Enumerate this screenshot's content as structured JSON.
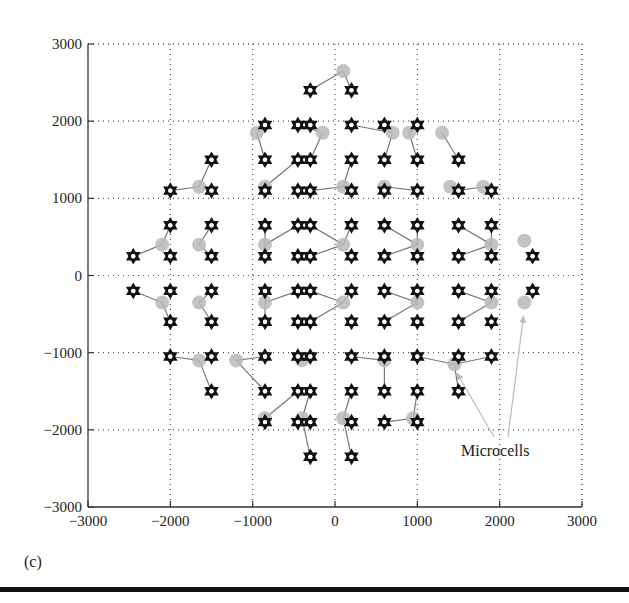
{
  "panel_label": "(c)",
  "annotation": {
    "text": "Microcells"
  },
  "colors": {
    "node": "#111111",
    "microcell": "#b8b8b8",
    "link": "#777777",
    "grid": "#555555",
    "arrow": "#bbbbbb"
  },
  "chart_data": {
    "type": "scatter",
    "title": "",
    "xlabel": "",
    "ylabel": "",
    "xlim": [
      -3000,
      3000
    ],
    "ylim": [
      -3000,
      3000
    ],
    "grid": true,
    "grid_style": "dotted",
    "xticks": [
      -3000,
      -2000,
      -1000,
      0,
      1000,
      2000,
      3000
    ],
    "yticks": [
      -3000,
      -2000,
      -1000,
      0,
      1000,
      2000,
      3000
    ],
    "xtick_labels": [
      "−3000",
      "−2000",
      "−1000",
      "0",
      "1000",
      "2000",
      "3000"
    ],
    "ytick_labels": [
      "−3000",
      "−2000",
      "−1000",
      "0",
      "1000",
      "2000",
      "3000"
    ],
    "annotations": [
      {
        "text": "Microcells",
        "x": 1900,
        "y": -2300,
        "arrows_to": [
          [
            1450,
            -1250
          ],
          [
            2280,
            -500
          ]
        ]
      }
    ],
    "series": [
      {
        "name": "Base stations",
        "marker": "star-of-david",
        "points": [
          [
            -300,
            2400
          ],
          [
            200,
            2400
          ],
          [
            -850,
            1950
          ],
          [
            -450,
            1950
          ],
          [
            -300,
            1950
          ],
          [
            200,
            1950
          ],
          [
            600,
            1950
          ],
          [
            1000,
            1950
          ],
          [
            -1500,
            1500
          ],
          [
            -850,
            1500
          ],
          [
            -450,
            1500
          ],
          [
            -300,
            1500
          ],
          [
            200,
            1500
          ],
          [
            600,
            1500
          ],
          [
            1000,
            1500
          ],
          [
            1500,
            1500
          ],
          [
            -2000,
            1100
          ],
          [
            -1500,
            1100
          ],
          [
            -850,
            1100
          ],
          [
            -450,
            1100
          ],
          [
            -300,
            1100
          ],
          [
            200,
            1100
          ],
          [
            600,
            1100
          ],
          [
            1000,
            1100
          ],
          [
            1500,
            1100
          ],
          [
            1900,
            1100
          ],
          [
            -2000,
            650
          ],
          [
            -1500,
            650
          ],
          [
            -850,
            650
          ],
          [
            -450,
            650
          ],
          [
            -300,
            650
          ],
          [
            200,
            650
          ],
          [
            600,
            650
          ],
          [
            1000,
            650
          ],
          [
            1500,
            650
          ],
          [
            1900,
            650
          ],
          [
            -2450,
            250
          ],
          [
            -2000,
            250
          ],
          [
            -1500,
            250
          ],
          [
            -850,
            250
          ],
          [
            -450,
            250
          ],
          [
            -300,
            250
          ],
          [
            200,
            250
          ],
          [
            600,
            250
          ],
          [
            1000,
            250
          ],
          [
            1500,
            250
          ],
          [
            1900,
            250
          ],
          [
            2400,
            250
          ],
          [
            -2450,
            -200
          ],
          [
            -2000,
            -200
          ],
          [
            -1500,
            -200
          ],
          [
            -850,
            -200
          ],
          [
            -450,
            -200
          ],
          [
            -300,
            -200
          ],
          [
            200,
            -200
          ],
          [
            600,
            -200
          ],
          [
            1000,
            -200
          ],
          [
            1500,
            -200
          ],
          [
            1900,
            -200
          ],
          [
            2400,
            -200
          ],
          [
            -2000,
            -600
          ],
          [
            -1500,
            -600
          ],
          [
            -850,
            -600
          ],
          [
            -450,
            -600
          ],
          [
            -300,
            -600
          ],
          [
            200,
            -600
          ],
          [
            600,
            -600
          ],
          [
            1000,
            -600
          ],
          [
            1500,
            -600
          ],
          [
            1900,
            -600
          ],
          [
            -2000,
            -1050
          ],
          [
            -1500,
            -1050
          ],
          [
            -850,
            -1050
          ],
          [
            -450,
            -1050
          ],
          [
            -300,
            -1050
          ],
          [
            200,
            -1050
          ],
          [
            600,
            -1050
          ],
          [
            1000,
            -1050
          ],
          [
            1500,
            -1050
          ],
          [
            1900,
            -1050
          ],
          [
            -1500,
            -1500
          ],
          [
            -850,
            -1500
          ],
          [
            -450,
            -1500
          ],
          [
            -300,
            -1500
          ],
          [
            200,
            -1500
          ],
          [
            600,
            -1500
          ],
          [
            1000,
            -1500
          ],
          [
            1500,
            -1500
          ],
          [
            -850,
            -1900
          ],
          [
            -450,
            -1900
          ],
          [
            -300,
            -1900
          ],
          [
            200,
            -1900
          ],
          [
            600,
            -1900
          ],
          [
            1000,
            -1900
          ],
          [
            -300,
            -2350
          ],
          [
            200,
            -2350
          ]
        ]
      },
      {
        "name": "Microcells",
        "marker": "circle",
        "points": [
          [
            100,
            2650
          ],
          [
            -950,
            1850
          ],
          [
            -150,
            1850
          ],
          [
            700,
            1850
          ],
          [
            900,
            1850
          ],
          [
            1300,
            1850
          ],
          [
            -1650,
            1150
          ],
          [
            -850,
            1150
          ],
          [
            100,
            1150
          ],
          [
            600,
            1150
          ],
          [
            1400,
            1150
          ],
          [
            1800,
            1150
          ],
          [
            -2100,
            400
          ],
          [
            -1650,
            400
          ],
          [
            -850,
            400
          ],
          [
            100,
            400
          ],
          [
            1000,
            400
          ],
          [
            1900,
            400
          ],
          [
            2300,
            450
          ],
          [
            -2100,
            -350
          ],
          [
            -1650,
            -350
          ],
          [
            -850,
            -350
          ],
          [
            100,
            -350
          ],
          [
            1000,
            -350
          ],
          [
            1900,
            -350
          ],
          [
            2300,
            -350
          ],
          [
            -1650,
            -1100
          ],
          [
            -1200,
            -1100
          ],
          [
            -400,
            -1100
          ],
          [
            600,
            -1100
          ],
          [
            1450,
            -1150
          ],
          [
            -850,
            -1850
          ],
          [
            -400,
            -1850
          ],
          [
            100,
            -1850
          ],
          [
            950,
            -1850
          ]
        ]
      }
    ],
    "links": [
      [
        [
          100,
          2650
        ],
        [
          -300,
          2400
        ]
      ],
      [
        [
          100,
          2650
        ],
        [
          200,
          2400
        ]
      ],
      [
        [
          -950,
          1850
        ],
        [
          -850,
          1950
        ]
      ],
      [
        [
          -950,
          1850
        ],
        [
          -850,
          1500
        ]
      ],
      [
        [
          -150,
          1850
        ],
        [
          -450,
          1950
        ]
      ],
      [
        [
          -150,
          1850
        ],
        [
          -300,
          1500
        ]
      ],
      [
        [
          700,
          1850
        ],
        [
          200,
          1950
        ]
      ],
      [
        [
          700,
          1850
        ],
        [
          600,
          1500
        ]
      ],
      [
        [
          900,
          1850
        ],
        [
          1000,
          1950
        ]
      ],
      [
        [
          900,
          1850
        ],
        [
          1000,
          1500
        ]
      ],
      [
        [
          1300,
          1850
        ],
        [
          1500,
          1500
        ]
      ],
      [
        [
          -1650,
          1150
        ],
        [
          -2000,
          1100
        ]
      ],
      [
        [
          -1650,
          1150
        ],
        [
          -1500,
          1500
        ]
      ],
      [
        [
          -850,
          1150
        ],
        [
          -850,
          1100
        ]
      ],
      [
        [
          -850,
          1150
        ],
        [
          -450,
          1500
        ]
      ],
      [
        [
          100,
          1150
        ],
        [
          -300,
          1100
        ]
      ],
      [
        [
          100,
          1150
        ],
        [
          200,
          1500
        ]
      ],
      [
        [
          600,
          1150
        ],
        [
          1000,
          1100
        ]
      ],
      [
        [
          1800,
          1150
        ],
        [
          1500,
          1100
        ]
      ],
      [
        [
          -2100,
          400
        ],
        [
          -2450,
          250
        ]
      ],
      [
        [
          -2100,
          400
        ],
        [
          -2000,
          650
        ]
      ],
      [
        [
          -1650,
          400
        ],
        [
          -1500,
          650
        ]
      ],
      [
        [
          -1650,
          400
        ],
        [
          -1500,
          250
        ]
      ],
      [
        [
          -850,
          400
        ],
        [
          -850,
          650
        ]
      ],
      [
        [
          -850,
          400
        ],
        [
          -850,
          250
        ]
      ],
      [
        [
          -850,
          400
        ],
        [
          -450,
          650
        ]
      ],
      [
        [
          100,
          400
        ],
        [
          -300,
          650
        ]
      ],
      [
        [
          100,
          400
        ],
        [
          -300,
          250
        ]
      ],
      [
        [
          100,
          400
        ],
        [
          200,
          650
        ]
      ],
      [
        [
          1000,
          400
        ],
        [
          600,
          650
        ]
      ],
      [
        [
          1000,
          400
        ],
        [
          600,
          250
        ]
      ],
      [
        [
          1000,
          400
        ],
        [
          1000,
          650
        ]
      ],
      [
        [
          1900,
          400
        ],
        [
          1500,
          650
        ]
      ],
      [
        [
          1900,
          400
        ],
        [
          1500,
          250
        ]
      ],
      [
        [
          1900,
          400
        ],
        [
          1900,
          650
        ]
      ],
      [
        [
          -2100,
          -350
        ],
        [
          -2450,
          -200
        ]
      ],
      [
        [
          -2100,
          -350
        ],
        [
          -2000,
          -600
        ]
      ],
      [
        [
          -1650,
          -350
        ],
        [
          -1500,
          -200
        ]
      ],
      [
        [
          -1650,
          -350
        ],
        [
          -1500,
          -600
        ]
      ],
      [
        [
          -850,
          -350
        ],
        [
          -850,
          -200
        ]
      ],
      [
        [
          -850,
          -350
        ],
        [
          -850,
          -600
        ]
      ],
      [
        [
          -850,
          -350
        ],
        [
          -450,
          -200
        ]
      ],
      [
        [
          100,
          -350
        ],
        [
          -300,
          -200
        ]
      ],
      [
        [
          100,
          -350
        ],
        [
          -300,
          -600
        ]
      ],
      [
        [
          100,
          -350
        ],
        [
          200,
          -200
        ]
      ],
      [
        [
          1000,
          -350
        ],
        [
          600,
          -200
        ]
      ],
      [
        [
          1000,
          -350
        ],
        [
          600,
          -600
        ]
      ],
      [
        [
          1000,
          -350
        ],
        [
          1000,
          -200
        ]
      ],
      [
        [
          1900,
          -350
        ],
        [
          1500,
          -200
        ]
      ],
      [
        [
          1900,
          -350
        ],
        [
          1500,
          -600
        ]
      ],
      [
        [
          1900,
          -350
        ],
        [
          1900,
          -200
        ]
      ],
      [
        [
          -1650,
          -1100
        ],
        [
          -2000,
          -1050
        ]
      ],
      [
        [
          -1650,
          -1100
        ],
        [
          -1500,
          -1500
        ]
      ],
      [
        [
          -1200,
          -1100
        ],
        [
          -850,
          -1050
        ]
      ],
      [
        [
          -1200,
          -1100
        ],
        [
          -850,
          -1500
        ]
      ],
      [
        [
          -400,
          -1100
        ],
        [
          -450,
          -1050
        ]
      ],
      [
        [
          600,
          -1100
        ],
        [
          200,
          -1050
        ]
      ],
      [
        [
          600,
          -1100
        ],
        [
          600,
          -1500
        ]
      ],
      [
        [
          1450,
          -1150
        ],
        [
          1000,
          -1050
        ]
      ],
      [
        [
          1450,
          -1150
        ],
        [
          1900,
          -1050
        ]
      ],
      [
        [
          1450,
          -1150
        ],
        [
          1500,
          -1500
        ]
      ],
      [
        [
          -850,
          -1850
        ],
        [
          -850,
          -1900
        ]
      ],
      [
        [
          -850,
          -1850
        ],
        [
          -450,
          -1500
        ]
      ],
      [
        [
          -400,
          -1850
        ],
        [
          -300,
          -1500
        ]
      ],
      [
        [
          -400,
          -1850
        ],
        [
          -300,
          -2350
        ]
      ],
      [
        [
          100,
          -1850
        ],
        [
          200,
          -1500
        ]
      ],
      [
        [
          100,
          -1850
        ],
        [
          200,
          -2350
        ]
      ],
      [
        [
          950,
          -1850
        ],
        [
          600,
          -1900
        ]
      ],
      [
        [
          950,
          -1850
        ],
        [
          1000,
          -1500
        ]
      ]
    ]
  }
}
